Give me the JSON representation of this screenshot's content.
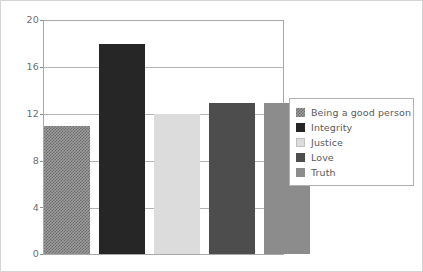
{
  "chart_data": {
    "type": "bar",
    "title": "",
    "subtitle": "",
    "xlabel": "",
    "ylabel": "",
    "categories": [
      "Being a good person",
      "Integrity",
      "Justice",
      "Love",
      "Truth"
    ],
    "values": [
      11,
      18,
      12,
      13,
      13
    ],
    "ylim": [
      0,
      20
    ],
    "yticks": [
      "0",
      "4",
      "8",
      "12",
      "16",
      "20"
    ],
    "ytick_values": [
      0,
      4,
      8,
      12,
      16,
      20
    ],
    "xticks": [],
    "grid": "horizontal",
    "legend_position": "right",
    "series": [
      {
        "name": "Being a good person",
        "value": 11,
        "fill": "checker",
        "color": "#808080"
      },
      {
        "name": "Integrity",
        "value": 18,
        "fill": "solid",
        "color": "#262626"
      },
      {
        "name": "Justice",
        "value": 12,
        "fill": "solid",
        "color": "#dcdcdc"
      },
      {
        "name": "Love",
        "value": 13,
        "fill": "solid",
        "color": "#4d4d4d"
      },
      {
        "name": "Truth",
        "value": 13,
        "fill": "solid",
        "color": "#8c8c8c"
      }
    ]
  },
  "legend": {
    "items": [
      {
        "label": "Being a good person",
        "swatch_class": "fill-checker"
      },
      {
        "label": "Integrity",
        "swatch_class": "fill-verydark"
      },
      {
        "label": "Justice",
        "swatch_class": "fill-verylight"
      },
      {
        "label": "Love",
        "swatch_class": "fill-dark"
      },
      {
        "label": "Truth",
        "swatch_class": "fill-medium"
      }
    ]
  },
  "style": {
    "plot_background": "#ffffff",
    "gridline_color": "#b4b4b4",
    "axis_color": "#8c8c8c",
    "text_color": "#6e6e6e",
    "frame_color": "#d4d4d4"
  }
}
